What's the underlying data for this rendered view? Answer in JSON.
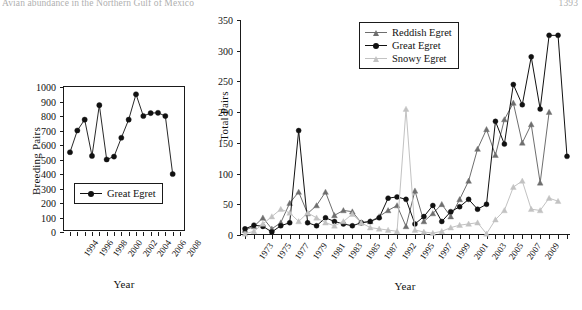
{
  "running_head": {
    "title": "Avian abundance in the Northern Gulf of Mexico",
    "page": "1393"
  },
  "figure": {
    "panels": [
      {
        "name": "left-panel",
        "ylabel": "Breeding Pairs",
        "xlabel": "Year",
        "legend": [
          "Great Egret"
        ]
      },
      {
        "name": "right-panel",
        "ylabel": "Total Pairs",
        "xlabel": "Year",
        "legend": [
          "Reddish Egret",
          "Great Egret",
          "Snowy Egret"
        ]
      }
    ]
  },
  "colors": {
    "reddish_egret": "#6e6e6e",
    "great_egret": "#111111",
    "snowy_egret": "#c2c2c2",
    "axis": "#1a1a1a"
  },
  "chart_data": [
    {
      "type": "line",
      "name": "left-panel",
      "title": "",
      "xlabel": "Year",
      "ylabel": "Breeding Pairs",
      "ylim": [
        0,
        1000
      ],
      "yticks": [
        0,
        100,
        200,
        300,
        400,
        500,
        600,
        700,
        800,
        900,
        1000
      ],
      "xlim": [
        1994,
        2009
      ],
      "xticks": [
        1994,
        1995,
        1996,
        1997,
        1998,
        1999,
        2000,
        2001,
        2002,
        2003,
        2004,
        2005,
        2006,
        2007,
        2008,
        2009
      ],
      "xtick_labels": [
        "1994",
        "",
        "1996",
        "",
        "1998",
        "",
        "2000",
        "",
        "2002",
        "",
        "2004",
        "",
        "2006",
        "",
        "2008",
        ""
      ],
      "grid": false,
      "legend_position": "lower-left",
      "series": [
        {
          "name": "Great Egret",
          "color": "#111111",
          "marker": "circle",
          "x": [
            1994,
            1995,
            1996,
            1997,
            1998,
            1999,
            2000,
            2001,
            2002,
            2003,
            2004,
            2005,
            2006,
            2007,
            2008
          ],
          "values": [
            550,
            700,
            775,
            525,
            875,
            500,
            520,
            650,
            775,
            950,
            800,
            820,
            822,
            800,
            400
          ]
        }
      ]
    },
    {
      "type": "line",
      "name": "right-panel",
      "title": "",
      "xlabel": "Year",
      "ylabel": "Total Pairs",
      "ylim": [
        0,
        350
      ],
      "yticks": [
        0,
        50,
        100,
        150,
        200,
        250,
        300,
        350
      ],
      "xtick_labels": [
        "1973",
        "",
        "1975",
        "",
        "1977",
        "",
        "1979",
        "",
        "1981",
        "",
        "1983",
        "",
        "1985",
        "",
        "1987",
        "",
        "1992",
        "",
        "1995",
        "",
        "1997",
        "",
        "1999",
        "",
        "2001",
        "",
        "2003",
        "",
        "2005",
        "",
        "2007",
        "",
        "2009"
      ],
      "x": [
        1973,
        1974,
        1975,
        1976,
        1977,
        1978,
        1979,
        1980,
        1981,
        1982,
        1983,
        1984,
        1985,
        1986,
        1987,
        1988,
        1992,
        1993,
        1994,
        1995,
        1996,
        1997,
        1998,
        1999,
        2000,
        2001,
        2002,
        2003,
        2004,
        2005,
        2006,
        2007,
        2008,
        2009,
        2010
      ],
      "grid": false,
      "legend_position": "upper-left",
      "series": [
        {
          "name": "Reddish Egret",
          "color": "#6e6e6e",
          "marker": "triangle",
          "values": [
            8,
            14,
            28,
            10,
            20,
            52,
            70,
            35,
            48,
            70,
            32,
            40,
            38,
            20,
            22,
            30,
            40,
            48,
            14,
            72,
            22,
            35,
            50,
            30,
            58,
            88,
            140,
            172,
            130,
            188,
            215,
            150,
            180,
            85,
            200
          ]
        },
        {
          "name": "Great Egret",
          "color": "#111111",
          "marker": "circle",
          "values": [
            10,
            16,
            14,
            5,
            15,
            20,
            170,
            20,
            15,
            28,
            22,
            18,
            15,
            20,
            22,
            28,
            60,
            62,
            58,
            18,
            30,
            48,
            22,
            38,
            46,
            58,
            42,
            50,
            185,
            148,
            245,
            212,
            290,
            205,
            325,
            325,
            128
          ]
        },
        {
          "name": "Snowy Egret",
          "color": "#c2c2c2",
          "marker": "triangle",
          "values": [
            2,
            6,
            18,
            30,
            42,
            36,
            22,
            36,
            28,
            20,
            15,
            22,
            34,
            20,
            12,
            10,
            8,
            6,
            205,
            8,
            5,
            3,
            6,
            12,
            16,
            18,
            20,
            2,
            25,
            40,
            78,
            88,
            42,
            40,
            60,
            55
          ]
        }
      ]
    }
  ]
}
